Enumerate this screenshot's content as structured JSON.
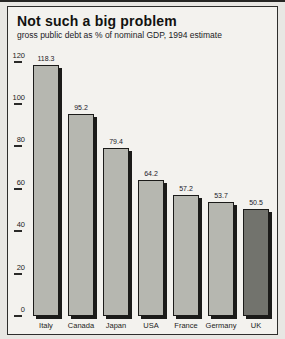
{
  "chart_data": {
    "type": "bar",
    "title": "Not such a big problem",
    "subtitle": "gross public debt as % of nominal GDP, 1994 estimate",
    "categories": [
      "Italy",
      "Canada",
      "Japan",
      "USA",
      "France",
      "Germany",
      "UK"
    ],
    "values": [
      118.3,
      95.2,
      79.4,
      64.2,
      57.2,
      53.7,
      50.5
    ],
    "value_labels": [
      "118.3",
      "95.2",
      "79.4",
      "64.2",
      "57.2",
      "53.7",
      "50.5"
    ],
    "xlabel": "",
    "ylabel": "",
    "ylim": [
      0,
      120
    ],
    "yticks": [
      0,
      20,
      40,
      60,
      80,
      100,
      120
    ],
    "grid": false,
    "legend": "none",
    "highlight_category": "UK",
    "colors": {
      "bar_fill": "#b6b7b0",
      "highlight_fill": "#72736d",
      "outline": "#1b1b19",
      "card_background": "#f3f2ee",
      "page_background": "#e8e7e3",
      "text": "#161614"
    }
  }
}
